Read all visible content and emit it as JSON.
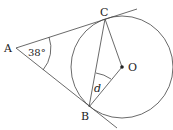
{
  "diagram": {
    "points": {
      "A": {
        "label": "A",
        "x": 16,
        "y": 48
      },
      "B": {
        "label": "B",
        "x": 89,
        "y": 107
      },
      "C": {
        "label": "C",
        "x": 105,
        "y": 19
      },
      "O": {
        "label": "O",
        "x": 122,
        "y": 67
      }
    },
    "angle_A": "38°",
    "angle_d": "d",
    "colors": {
      "stroke": "#333333",
      "background": "#ffffff"
    }
  }
}
